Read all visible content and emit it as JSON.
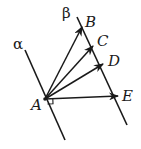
{
  "diagram": {
    "planes": [
      {
        "id": "alpha",
        "label": "α",
        "x1": 25,
        "y1": 50,
        "x2": 65,
        "y2": 140
      },
      {
        "id": "beta",
        "label": "β",
        "x1": 77,
        "y1": 17,
        "x2": 127,
        "y2": 125
      }
    ],
    "origin": {
      "label": "A",
      "x": 45,
      "y": 99
    },
    "vectors": [
      {
        "label": "B",
        "x": 82,
        "y": 27
      },
      {
        "label": "C",
        "x": 93,
        "y": 46
      },
      {
        "label": "D",
        "x": 103,
        "y": 64
      },
      {
        "label": "E",
        "x": 118,
        "y": 96
      }
    ],
    "right_angle_marker": {
      "at": "A",
      "between": [
        "alpha",
        "AE"
      ]
    },
    "colors": {
      "stroke": "#1a1a1a",
      "background": "#ffffff"
    }
  }
}
